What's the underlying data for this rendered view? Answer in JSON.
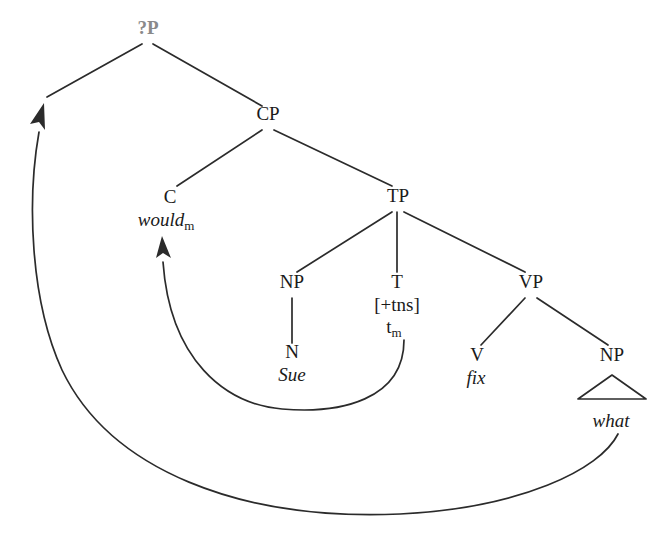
{
  "figure": {
    "type": "syntax-tree",
    "background_color": "#ffffff",
    "line_color": "#2b2b2b",
    "root_color": "#8a8a8a"
  },
  "nodes": {
    "root": {
      "label": "?P",
      "x": 148,
      "y": 34
    },
    "cp": {
      "label": "CP",
      "x": 268,
      "y": 120
    },
    "c": {
      "label": "C",
      "x": 170,
      "y": 203
    },
    "c_word": {
      "label": "would",
      "subscript": "m",
      "x": 166,
      "y": 226
    },
    "tp": {
      "label": "TP",
      "x": 398,
      "y": 202
    },
    "np_subj": {
      "label": "NP",
      "x": 292,
      "y": 288
    },
    "n_subj": {
      "label": "N",
      "x": 292,
      "y": 358
    },
    "n_word": {
      "label": "Sue",
      "x": 292,
      "y": 381
    },
    "t": {
      "label": "T",
      "x": 397,
      "y": 288
    },
    "t_feature": {
      "label": "[+tns]",
      "x": 397,
      "y": 311
    },
    "t_trace": {
      "label": "t",
      "subscript": "m",
      "x": 394,
      "y": 333
    },
    "vp": {
      "label": "VP",
      "x": 531,
      "y": 288
    },
    "v": {
      "label": "V",
      "x": 477,
      "y": 361
    },
    "v_word": {
      "label": "fix",
      "x": 476,
      "y": 384
    },
    "np_obj": {
      "label": "NP",
      "x": 612,
      "y": 361
    },
    "np_obj_word": {
      "label": "what",
      "x": 611,
      "y": 427
    }
  },
  "branches": [
    {
      "name": "root-to-spec",
      "from": "?P",
      "to": "specifier-position"
    },
    {
      "name": "root-to-cp",
      "from": "?P",
      "to": "CP"
    },
    {
      "name": "cp-to-c",
      "from": "CP",
      "to": "C"
    },
    {
      "name": "cp-to-tp",
      "from": "CP",
      "to": "TP"
    },
    {
      "name": "tp-to-np",
      "from": "TP",
      "to": "NP"
    },
    {
      "name": "tp-to-t",
      "from": "TP",
      "to": "T"
    },
    {
      "name": "tp-to-vp",
      "from": "TP",
      "to": "VP"
    },
    {
      "name": "np-to-n",
      "from": "NP",
      "to": "N"
    },
    {
      "name": "vp-to-v",
      "from": "VP",
      "to": "V"
    },
    {
      "name": "vp-to-np",
      "from": "VP",
      "to": "NP"
    }
  ],
  "triangle": {
    "name": "np-object-triangle",
    "apex_x": 612,
    "apex_y": 375,
    "left_x": 578,
    "right_x": 646,
    "base_y": 399
  },
  "movement_arrows": [
    {
      "name": "head-movement-t-to-c",
      "from_label": "t_m",
      "to_label": "would_m",
      "type": "head-movement"
    },
    {
      "name": "wh-movement-what-to-spec",
      "from_label": "what",
      "to_label": "specifier-of-?P",
      "type": "wh-movement"
    }
  ]
}
